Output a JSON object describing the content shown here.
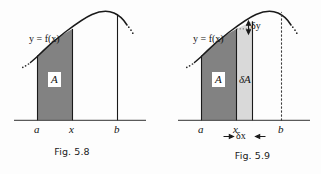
{
  "figures": [
    {
      "id": "fig-5-8",
      "caption": "Fig. 5.8",
      "curve_label": "y = f(x)",
      "curve_label_y": "y",
      "curve_label_eq": " = f(",
      "curve_label_x": "x",
      "curve_label_close": ")",
      "axis_labels": {
        "a": "a",
        "x": "x",
        "b": "b"
      },
      "region_label": "A",
      "shade_color": "#828282",
      "curve_color": "#1a1a1a",
      "axis_color": "#5a5a5a"
    },
    {
      "id": "fig-5-9",
      "caption": "Fig. 5.9",
      "curve_label": "y = f(x)",
      "curve_label_y": "y",
      "curve_label_eq": " = f(",
      "curve_label_x": "x",
      "curve_label_close": ")",
      "axis_labels": {
        "a": "a",
        "x": "x",
        "b": "b"
      },
      "region_label": "A",
      "strip_label": "δA",
      "strip_label_delta": "δ",
      "strip_label_A": "A",
      "delta_x_label": "δx",
      "delta_x_delta": "δ",
      "delta_x_var": "x",
      "delta_y_label": "δy",
      "delta_y_delta": "δ",
      "delta_y_var": "y",
      "shade_color": "#828282",
      "strip_color": "#d9d9d9",
      "curve_color": "#1a1a1a",
      "axis_color": "#5a5a5a"
    }
  ],
  "colors": {
    "background": "#fdfdfd",
    "dark_shade": "#828282",
    "light_shade": "#d9d9d9",
    "ink": "#1a1a1a",
    "axis": "#5a5a5a"
  }
}
